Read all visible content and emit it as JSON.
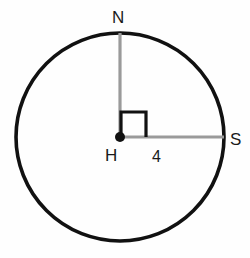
{
  "figure": {
    "background_color": "#fefefe",
    "width": 250,
    "height": 258
  },
  "circle": {
    "name": "circle-H",
    "center_x": 120,
    "center_y": 137,
    "radius": 104,
    "stroke_color": "#111111",
    "stroke_width": 3.6,
    "fill": "none"
  },
  "center_point": {
    "label": "H",
    "x": 120,
    "y": 137,
    "dot_radius": 5,
    "color": "#111111"
  },
  "radii": [
    {
      "name": "radius-HN",
      "from": "H",
      "to": "N",
      "x1": 120,
      "y1": 137,
      "x2": 120,
      "y2": 33,
      "stroke_color": "#9a9a9a",
      "stroke_width": 3.2,
      "orientation": "vertical"
    },
    {
      "name": "radius-HS",
      "from": "H",
      "to": "S",
      "x1": 120,
      "y1": 137,
      "x2": 224,
      "y2": 137,
      "stroke_color": "#9a9a9a",
      "stroke_width": 3.2,
      "orientation": "horizontal",
      "measure": "4"
    }
  ],
  "right_angle_marker": {
    "name": "right-angle-marker",
    "vertex_x": 120,
    "vertex_y": 137,
    "size": 25,
    "stroke_color": "#111111",
    "stroke_width": 3.2,
    "path": "M 121 137 L 121 112 L 146 112 L 146 137"
  },
  "labels": {
    "north": "N",
    "south": "S",
    "center": "H",
    "radius_measure": "4"
  },
  "colors": {
    "stroke_dark": "#111111",
    "stroke_gray": "#9a9a9a",
    "text": "#1a1a1a",
    "background": "#fefefe"
  }
}
